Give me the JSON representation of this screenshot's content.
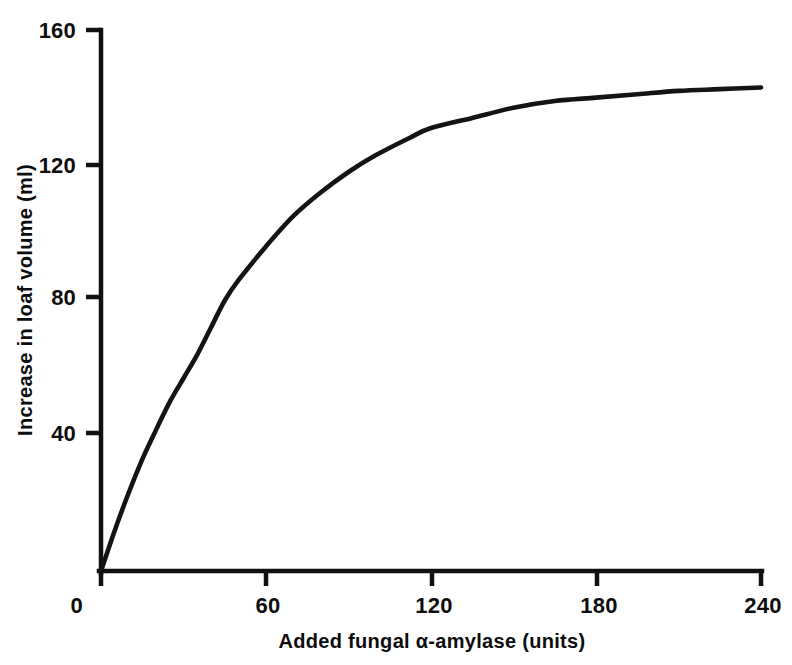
{
  "chart_data": {
    "type": "line",
    "title": "",
    "xlabel": "Added fungal α-amylase  (units)",
    "ylabel": "Increase in loaf volume (ml)",
    "xlim": [
      0,
      240
    ],
    "ylim": [
      0,
      160
    ],
    "xticks": [
      0,
      60,
      120,
      180,
      240
    ],
    "yticks": [
      0,
      40,
      80,
      120,
      160
    ],
    "xtick_labels": [
      "0",
      "60",
      "120",
      "180",
      "240"
    ],
    "ytick_labels": [
      "0",
      "40",
      "80",
      "120",
      "160"
    ],
    "grid": false,
    "legend": null,
    "series": [
      {
        "name": "Increase in loaf volume",
        "color": "#141414",
        "x": [
          0,
          5,
          10,
          15,
          19,
          25,
          30,
          35,
          40,
          45,
          50,
          60,
          70,
          80,
          90,
          100,
          112,
          120,
          135,
          150,
          165,
          180,
          195,
          210,
          225,
          240
        ],
        "y": [
          0,
          12,
          23,
          33,
          40,
          50,
          57,
          64,
          72,
          80,
          86,
          96,
          105,
          112,
          118,
          123,
          128,
          131,
          134,
          137,
          139,
          140,
          141,
          142,
          142.5,
          143
        ]
      }
    ],
    "annotations": []
  },
  "axes": {
    "y_axis_label": "Increase in loaf volume (ml)",
    "x_axis_label": "Added fungal α-amylase  (units)",
    "y_tick_labels": [
      "160",
      "120",
      "80",
      "40",
      "0"
    ],
    "x_tick_labels": [
      "0",
      "60",
      "120",
      "180",
      "240"
    ],
    "line_color": "#111111"
  }
}
